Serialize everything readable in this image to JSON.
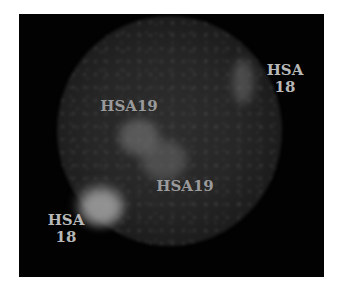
{
  "figure": {
    "background_color": "#020202",
    "page_color": "#ffffff",
    "label_color": "#b8b8b8"
  },
  "labels": [
    {
      "id": "hsa18-top-right",
      "text": "HSA\n18"
    },
    {
      "id": "hsa19-upper",
      "text": "HSA19"
    },
    {
      "id": "hsa19-lower",
      "text": "HSA19"
    },
    {
      "id": "hsa18-bottom-left",
      "text": "HSA\n18"
    }
  ],
  "signals": [
    {
      "name": "hsa18-signal-top-right",
      "brightness": "moderate"
    },
    {
      "name": "hsa19-signal-center-upper",
      "brightness": "moderate"
    },
    {
      "name": "hsa19-signal-center-lower",
      "brightness": "moderate"
    },
    {
      "name": "hsa18-signal-bottom-left",
      "brightness": "bright"
    }
  ]
}
